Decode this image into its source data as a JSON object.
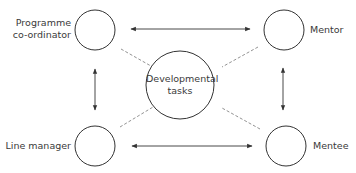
{
  "diagram": {
    "type": "relationship-diagram",
    "colors": {
      "stroke": "#333333",
      "dashed": "#777777",
      "text": "#3a3a3a",
      "background": "#ffffff"
    },
    "nodes": [
      {
        "id": "programme-coordinator",
        "label_line1": "Programme",
        "label_line2": "co-ordinator"
      },
      {
        "id": "mentor",
        "label": "Mentor"
      },
      {
        "id": "developmental-tasks",
        "label_line1": "Developmental",
        "label_line2": "tasks"
      },
      {
        "id": "line-manager",
        "label": "Line manager"
      },
      {
        "id": "mentee",
        "label": "Mentee"
      }
    ],
    "edges": [
      {
        "from": "programme-coordinator",
        "to": "mentor",
        "style": "solid",
        "arrows": "both"
      },
      {
        "from": "programme-coordinator",
        "to": "line-manager",
        "style": "solid",
        "arrows": "both"
      },
      {
        "from": "mentor",
        "to": "mentee",
        "style": "solid",
        "arrows": "both"
      },
      {
        "from": "line-manager",
        "to": "mentee",
        "style": "solid",
        "arrows": "both"
      },
      {
        "from": "programme-coordinator",
        "to": "developmental-tasks",
        "style": "dashed",
        "arrows": "none"
      },
      {
        "from": "mentor",
        "to": "developmental-tasks",
        "style": "dashed",
        "arrows": "none"
      },
      {
        "from": "line-manager",
        "to": "developmental-tasks",
        "style": "dashed",
        "arrows": "none"
      },
      {
        "from": "mentee",
        "to": "developmental-tasks",
        "style": "dashed",
        "arrows": "none"
      }
    ]
  }
}
